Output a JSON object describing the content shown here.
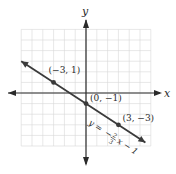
{
  "chart_data": {
    "type": "line",
    "title": "",
    "xlabel": "x",
    "ylabel": "y",
    "xlim": [
      -6,
      6
    ],
    "ylim": [
      -5,
      6
    ],
    "grid": true,
    "equation": "y = −(2/3)x − 1",
    "equation_parts": {
      "lhs": "y =",
      "neg": "−",
      "num": "2",
      "den": "3",
      "rest": "x − 1"
    },
    "line": {
      "slope": -0.6667,
      "intercept": -1,
      "x_start": -6,
      "x_end": 5.5
    },
    "points": [
      {
        "x": -3,
        "y": 1,
        "label": "(−3, 1)"
      },
      {
        "x": 0,
        "y": -1,
        "label": "(0, −1)"
      },
      {
        "x": 3,
        "y": -3,
        "label": "(3, −3)"
      }
    ],
    "colors": {
      "line": "#3a3a3a",
      "axis": "#2a2a2a",
      "grid": "#d6d6d6",
      "point": "#3a3a3a"
    }
  }
}
